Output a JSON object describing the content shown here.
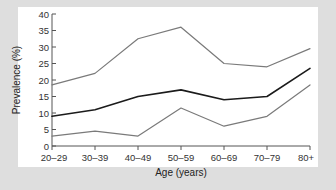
{
  "chart_data": {
    "type": "line",
    "title": "",
    "xlabel": "Age (years)",
    "ylabel": "Prevalence (%)",
    "categories": [
      "20–29",
      "30–39",
      "40–49",
      "50–59",
      "60–69",
      "70–79",
      "80+"
    ],
    "ylim": [
      0,
      40
    ],
    "yticks": [
      0,
      5,
      10,
      15,
      20,
      25,
      30,
      35,
      40
    ],
    "ytick_labels": [
      "0",
      "5",
      "10",
      "15",
      "20",
      "25",
      "30",
      "35",
      "40"
    ],
    "grid": false,
    "legend": "none",
    "series": [
      {
        "name": "upper-bound",
        "color": "#7a7a7a",
        "stroke_width": 1.2,
        "values": [
          18.5,
          22.0,
          32.5,
          36.0,
          25.0,
          24.0,
          29.5
        ]
      },
      {
        "name": "central-estimate",
        "color": "#1b1b1b",
        "stroke_width": 1.6,
        "values": [
          9.0,
          11.0,
          15.0,
          17.0,
          14.0,
          15.0,
          23.5
        ]
      },
      {
        "name": "lower-bound",
        "color": "#7a7a7a",
        "stroke_width": 1.2,
        "values": [
          3.0,
          4.5,
          3.0,
          11.5,
          6.0,
          9.0,
          18.5
        ]
      }
    ]
  },
  "figure": {
    "background_color": "#dedede",
    "plot_background_color": "#ffffff",
    "axis_color": "#555555"
  }
}
